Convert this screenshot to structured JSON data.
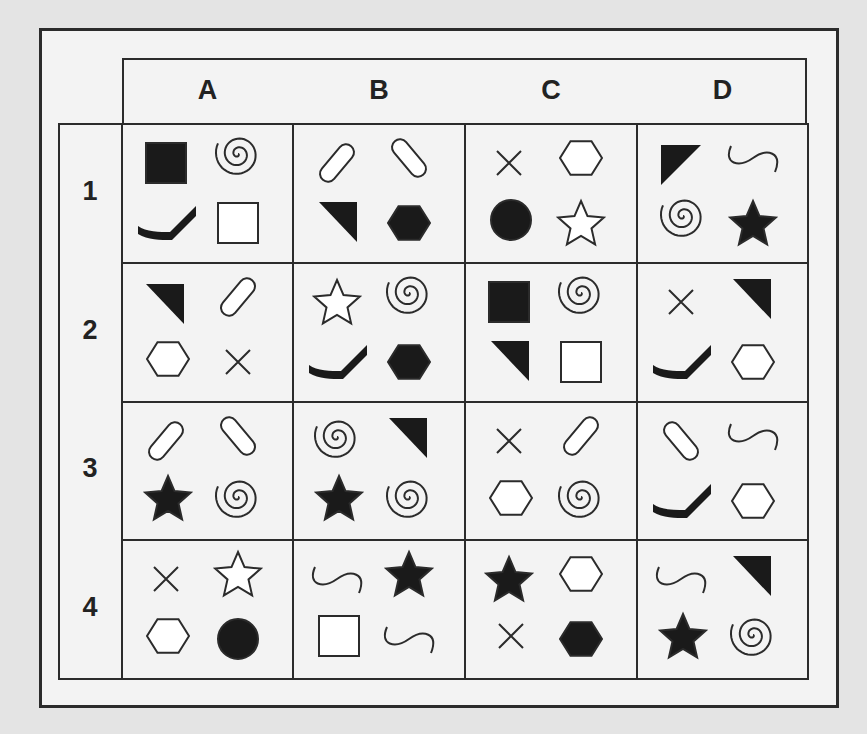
{
  "columns": [
    "A",
    "B",
    "C",
    "D"
  ],
  "rows": [
    "1",
    "2",
    "3",
    "4"
  ],
  "colors": {
    "background": "#e4e4e4",
    "panel": "#f3f3f3",
    "line": "#2b2b2b",
    "fill": "#1a1a1a"
  },
  "cells": {
    "A1": [
      {
        "shape": "square",
        "fill": "black",
        "pos": "tl"
      },
      {
        "shape": "spiral",
        "fill": "none",
        "pos": "tr"
      },
      {
        "shape": "hockey-stick",
        "fill": "black",
        "pos": "bl"
      },
      {
        "shape": "square",
        "fill": "white",
        "pos": "br"
      }
    ],
    "B1": [
      {
        "shape": "capsule-right",
        "fill": "white",
        "pos": "tl"
      },
      {
        "shape": "capsule-left",
        "fill": "white",
        "pos": "tr"
      },
      {
        "shape": "triangle",
        "fill": "black",
        "pos": "bl"
      },
      {
        "shape": "hexagon",
        "fill": "black",
        "pos": "br"
      }
    ],
    "C1": [
      {
        "shape": "cross",
        "fill": "none",
        "pos": "tl"
      },
      {
        "shape": "hexagon",
        "fill": "white",
        "pos": "tr"
      },
      {
        "shape": "circle",
        "fill": "black",
        "pos": "bl"
      },
      {
        "shape": "star",
        "fill": "white",
        "pos": "br"
      }
    ],
    "D1": [
      {
        "shape": "triangle-tl",
        "fill": "black",
        "pos": "tl"
      },
      {
        "shape": "wave",
        "fill": "none",
        "pos": "tr"
      },
      {
        "shape": "spiral",
        "fill": "none",
        "pos": "bl"
      },
      {
        "shape": "star",
        "fill": "black",
        "pos": "br"
      }
    ],
    "A2": [
      {
        "shape": "triangle",
        "fill": "black",
        "pos": "tl"
      },
      {
        "shape": "capsule-right",
        "fill": "white",
        "pos": "tr"
      },
      {
        "shape": "hexagon",
        "fill": "white",
        "pos": "bl"
      },
      {
        "shape": "cross",
        "fill": "none",
        "pos": "br"
      }
    ],
    "B2": [
      {
        "shape": "star",
        "fill": "white",
        "pos": "tl"
      },
      {
        "shape": "spiral",
        "fill": "none",
        "pos": "tr"
      },
      {
        "shape": "hockey-stick",
        "fill": "black",
        "pos": "bl"
      },
      {
        "shape": "hexagon",
        "fill": "black",
        "pos": "br"
      }
    ],
    "C2": [
      {
        "shape": "square",
        "fill": "black",
        "pos": "tl"
      },
      {
        "shape": "spiral",
        "fill": "none",
        "pos": "tr"
      },
      {
        "shape": "triangle",
        "fill": "black",
        "pos": "bl"
      },
      {
        "shape": "square",
        "fill": "white",
        "pos": "br"
      }
    ],
    "D2": [
      {
        "shape": "cross",
        "fill": "none",
        "pos": "tl"
      },
      {
        "shape": "triangle",
        "fill": "black",
        "pos": "tr"
      },
      {
        "shape": "hockey-stick",
        "fill": "black",
        "pos": "bl"
      },
      {
        "shape": "hexagon",
        "fill": "white",
        "pos": "br"
      }
    ],
    "A3": [
      {
        "shape": "capsule-right",
        "fill": "white",
        "pos": "tl"
      },
      {
        "shape": "capsule-left",
        "fill": "white",
        "pos": "tr"
      },
      {
        "shape": "star",
        "fill": "black",
        "pos": "bl"
      },
      {
        "shape": "spiral",
        "fill": "none",
        "pos": "br"
      }
    ],
    "B3": [
      {
        "shape": "spiral",
        "fill": "none",
        "pos": "tl"
      },
      {
        "shape": "triangle",
        "fill": "black",
        "pos": "tr"
      },
      {
        "shape": "star",
        "fill": "black",
        "pos": "bl"
      },
      {
        "shape": "spiral",
        "fill": "none",
        "pos": "br"
      }
    ],
    "C3": [
      {
        "shape": "cross",
        "fill": "none",
        "pos": "tl"
      },
      {
        "shape": "capsule-right",
        "fill": "white",
        "pos": "tr"
      },
      {
        "shape": "hexagon",
        "fill": "white",
        "pos": "bl"
      },
      {
        "shape": "spiral",
        "fill": "none",
        "pos": "br"
      }
    ],
    "D3": [
      {
        "shape": "capsule-left",
        "fill": "white",
        "pos": "tl"
      },
      {
        "shape": "wave",
        "fill": "none",
        "pos": "tr"
      },
      {
        "shape": "hockey-stick",
        "fill": "black",
        "pos": "bl"
      },
      {
        "shape": "hexagon",
        "fill": "white",
        "pos": "br"
      }
    ],
    "A4": [
      {
        "shape": "cross",
        "fill": "none",
        "pos": "tl"
      },
      {
        "shape": "star",
        "fill": "white",
        "pos": "tr"
      },
      {
        "shape": "hexagon",
        "fill": "white",
        "pos": "bl"
      },
      {
        "shape": "circle",
        "fill": "black",
        "pos": "br"
      }
    ],
    "B4": [
      {
        "shape": "wave",
        "fill": "none",
        "pos": "tl"
      },
      {
        "shape": "star",
        "fill": "black",
        "pos": "tr"
      },
      {
        "shape": "square",
        "fill": "white",
        "pos": "bl"
      },
      {
        "shape": "wave",
        "fill": "none",
        "pos": "br"
      }
    ],
    "C4": [
      {
        "shape": "star",
        "fill": "black",
        "pos": "tl"
      },
      {
        "shape": "hexagon",
        "fill": "white",
        "pos": "tr"
      },
      {
        "shape": "cross",
        "fill": "none",
        "pos": "bl"
      },
      {
        "shape": "hexagon",
        "fill": "black",
        "pos": "br"
      }
    ],
    "D4": [
      {
        "shape": "wave",
        "fill": "none",
        "pos": "tl"
      },
      {
        "shape": "triangle",
        "fill": "black",
        "pos": "tr"
      },
      {
        "shape": "star",
        "fill": "black",
        "pos": "bl"
      },
      {
        "shape": "spiral",
        "fill": "none",
        "pos": "br"
      }
    ]
  }
}
